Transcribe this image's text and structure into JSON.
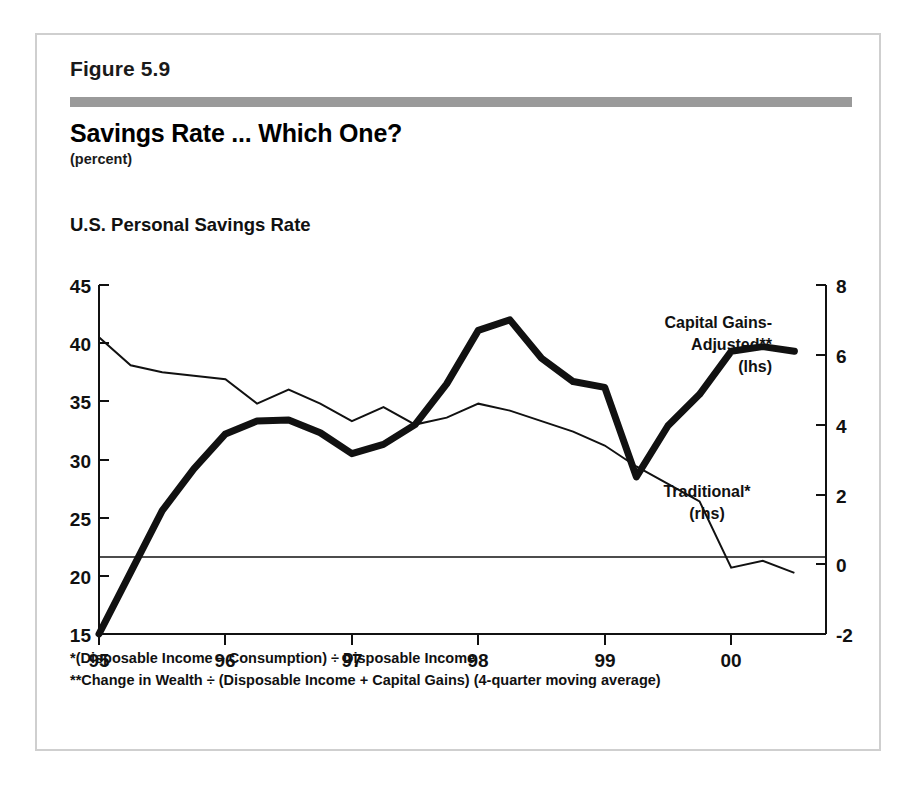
{
  "figure": {
    "number_label": "Figure 5.9",
    "title": "Savings Rate ... Which One?",
    "units": "(percent)",
    "series_heading": "U.S. Personal Savings Rate",
    "rule_color": "#9a9a9a",
    "border_color": "#cfcfcf",
    "ink_color": "#111111"
  },
  "annotations": {
    "capital_gains_line1": "Capital Gains-",
    "capital_gains_line2": "Adjusted**",
    "capital_gains_line3": "(lhs)",
    "traditional_line1": "Traditional*",
    "traditional_line2": "(rhs)"
  },
  "footnotes": [
    "*(Disposable Income – Consumption) ÷ Disposable Income",
    "**Change in Wealth ÷ (Disposable Income + Capital Gains)   (4-quarter moving average)"
  ],
  "axis_labels": {
    "left": [
      "45",
      "40",
      "35",
      "30",
      "25",
      "20",
      "15"
    ],
    "right": [
      "8",
      "6",
      "4",
      "2",
      "0",
      "-2"
    ],
    "bottom": [
      "95",
      "96",
      "97",
      "98",
      "99",
      "00"
    ]
  },
  "chart_data": {
    "type": "line",
    "title": "Savings Rate ... Which One?",
    "subtitle": "U.S. Personal Savings Rate",
    "units": "percent",
    "xlabel": "",
    "ylabel": "",
    "grid": false,
    "legend_position": "inline-annotation",
    "xlim": [
      1995.0,
      2000.75
    ],
    "x_ticks": [
      1995,
      1996,
      1997,
      1998,
      1999,
      2000
    ],
    "x_tick_labels": [
      "95",
      "96",
      "97",
      "98",
      "99",
      "00"
    ],
    "left_axis": {
      "name": "Capital Gains-Adjusted savings rate (lhs)",
      "ylim": [
        15,
        45
      ],
      "ticks": [
        15,
        20,
        25,
        30,
        35,
        40,
        45
      ],
      "unit": "percent"
    },
    "right_axis": {
      "name": "Traditional savings rate (rhs)",
      "ylim": [
        -2,
        8
      ],
      "ticks": [
        -2,
        0,
        2,
        4,
        6,
        8
      ],
      "unit": "percent"
    },
    "zero_line": {
      "axis": "right",
      "value": 0,
      "left_axis_equivalent": 21.0
    },
    "series": [
      {
        "name": "Capital Gains-Adjusted**",
        "axis": "left",
        "style": "thick-black",
        "line_width_px": 7,
        "label": "Capital Gains-Adjusted** (lhs)",
        "x": [
          1995.0,
          1995.25,
          1995.5,
          1995.75,
          1996.0,
          1996.25,
          1996.5,
          1996.75,
          1997.0,
          1997.25,
          1997.5,
          1997.75,
          1998.0,
          1998.25,
          1998.5,
          1998.75,
          1999.0,
          1999.25,
          1999.5,
          1999.75,
          2000.0,
          2000.25,
          2000.5
        ],
        "values": [
          15.0,
          20.3,
          25.6,
          29.2,
          32.2,
          33.3,
          33.4,
          32.3,
          30.5,
          31.3,
          33.0,
          36.5,
          41.1,
          42.0,
          38.7,
          36.7,
          36.2,
          28.5,
          32.9,
          35.6,
          39.3,
          39.7,
          39.3
        ]
      },
      {
        "name": "Traditional*",
        "axis": "right",
        "style": "thin-black",
        "line_width_px": 2,
        "label": "Traditional* (rhs)",
        "x": [
          1995.0,
          1995.25,
          1995.5,
          1995.75,
          1996.0,
          1996.25,
          1996.5,
          1996.75,
          1997.0,
          1997.25,
          1997.5,
          1997.75,
          1998.0,
          1998.25,
          1998.5,
          1998.75,
          1999.0,
          1999.25,
          1999.5,
          1999.75,
          2000.0,
          2000.25,
          2000.5
        ],
        "values": [
          6.5,
          5.7,
          5.5,
          5.4,
          5.3,
          4.6,
          5.0,
          4.6,
          4.1,
          4.5,
          4.0,
          4.2,
          4.6,
          4.4,
          4.1,
          3.8,
          3.4,
          2.8,
          2.3,
          1.8,
          -0.1,
          0.1,
          -0.25
        ]
      }
    ]
  }
}
